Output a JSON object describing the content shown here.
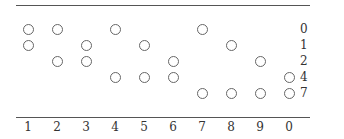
{
  "diagram": {
    "type": "two-of-five code table",
    "row_labels": [
      "0",
      "1",
      "2",
      "4",
      "7"
    ],
    "column_labels": [
      "1",
      "2",
      "3",
      "4",
      "5",
      "6",
      "7",
      "8",
      "9",
      "0"
    ],
    "columns": [
      {
        "digit": "1",
        "marks": [
          "0",
          "1"
        ]
      },
      {
        "digit": "2",
        "marks": [
          "0",
          "2"
        ]
      },
      {
        "digit": "3",
        "marks": [
          "1",
          "2"
        ]
      },
      {
        "digit": "4",
        "marks": [
          "0",
          "4"
        ]
      },
      {
        "digit": "5",
        "marks": [
          "1",
          "4"
        ]
      },
      {
        "digit": "6",
        "marks": [
          "2",
          "4"
        ]
      },
      {
        "digit": "7",
        "marks": [
          "0",
          "7"
        ]
      },
      {
        "digit": "8",
        "marks": [
          "1",
          "7"
        ]
      },
      {
        "digit": "9",
        "marks": [
          "2",
          "7"
        ]
      },
      {
        "digit": "0",
        "marks": [
          "4",
          "7"
        ]
      }
    ],
    "mark_symbol": "open-circle",
    "colors": {
      "line": "#555555",
      "circle": "#666666",
      "text": "#333333"
    }
  }
}
